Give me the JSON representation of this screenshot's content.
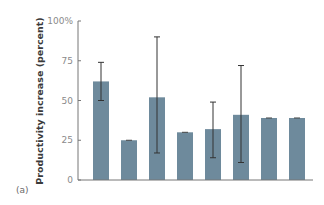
{
  "chart_data": {
    "type": "bar",
    "title": "",
    "panel_label": "(a)",
    "xlabel": "",
    "ylabel": "Productivity increase (percent)",
    "ylim": [
      0,
      100
    ],
    "yticks": [
      0,
      25,
      50,
      75,
      100
    ],
    "ytick_labels": [
      "0",
      "25",
      "50",
      "75",
      "100%"
    ],
    "grid": false,
    "legend": null,
    "categories": [
      "1",
      "2",
      "3",
      "4",
      "5",
      "6",
      "7",
      "8"
    ],
    "values": [
      62,
      25,
      52,
      30,
      32,
      41,
      39,
      39
    ],
    "error_low": [
      50,
      25,
      17,
      30,
      14,
      11,
      39,
      39
    ],
    "error_high": [
      74,
      25,
      90,
      30,
      49,
      72,
      39,
      39
    ],
    "colors": {
      "bar": "#6e8a9c",
      "error_bar": "#333333",
      "axis": "#777777"
    }
  }
}
